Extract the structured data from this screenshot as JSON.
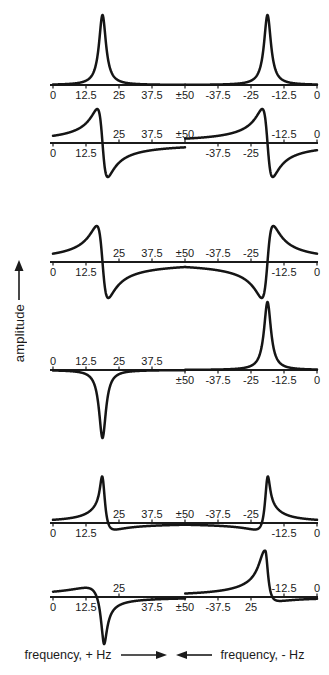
{
  "figure": {
    "ylabel": "amplitude",
    "xlabel_positive": "frequency, + Hz",
    "xlabel_negative": "frequency, - Hz"
  },
  "chart_data": {
    "type": "line",
    "title": "",
    "xlabel": "frequency (+ Hz left half, - Hz right half)",
    "ylabel": "amplitude",
    "x_axis": {
      "unit": "Hz",
      "layout": "positive frequencies 0 to +50 run left-to-right on the left half; negative frequencies -50 to 0 run left-to-right on the right half; axis wraps at ±50",
      "tick_labels": [
        "0",
        "12.5",
        "25",
        "37.5",
        "±50",
        "-37.5",
        "-25",
        "-12.5",
        "0"
      ],
      "tick_values_hz": [
        0,
        12.5,
        25,
        37.5,
        50,
        -37.5,
        -25,
        -12.5,
        0
      ]
    },
    "peak_frequencies_hz": [
      18.75,
      -18.75
    ],
    "geometry": {
      "width": 329,
      "height": 675,
      "x_at_u0": 53,
      "x_at_u100": 317,
      "axis_x1": 50,
      "axis_x2": 318
    },
    "panels": [
      {
        "name": "absorption-doublet-both-positive",
        "axis_y": 85,
        "components_pos": [
          {
            "kind": "abs",
            "f": 18.75,
            "w": 1.6,
            "amp": 70
          }
        ],
        "components_neg": [
          {
            "kind": "abs",
            "f": -18.75,
            "w": 1.6,
            "amp": 70
          }
        ],
        "ticks": [
          {
            "label": "0",
            "u": 0,
            "side": "below"
          },
          {
            "label": "12.5",
            "u": 12.5,
            "side": "below"
          },
          {
            "label": "25",
            "u": 25,
            "side": "below"
          },
          {
            "label": "37.5",
            "u": 37.5,
            "side": "below"
          },
          {
            "label": "±50",
            "u": 50,
            "side": "below"
          },
          {
            "label": "-37.5",
            "u": 62.5,
            "side": "below"
          },
          {
            "label": "-25",
            "u": 75,
            "side": "below"
          },
          {
            "label": "-12.5",
            "u": 87.5,
            "side": "below"
          },
          {
            "label": "0",
            "u": 100,
            "side": "below"
          }
        ]
      },
      {
        "name": "dispersion-doublet-same-sign",
        "axis_y": 143,
        "components_pos": [
          {
            "kind": "disp",
            "f": 18.75,
            "w": 2.0,
            "amp": 34
          }
        ],
        "components_neg": [
          {
            "kind": "disp",
            "f": -18.75,
            "w": 2.0,
            "amp": 34
          }
        ],
        "ticks": [
          {
            "label": "0",
            "u": 0,
            "side": "below"
          },
          {
            "label": "12.5",
            "u": 12.5,
            "side": "below"
          },
          {
            "label": "25",
            "u": 25,
            "side": "above"
          },
          {
            "label": "37.5",
            "u": 37.5,
            "side": "above"
          },
          {
            "label": "±50",
            "u": 50,
            "side": "above"
          },
          {
            "label": "-37.5",
            "u": 62.5,
            "side": "below"
          },
          {
            "label": "-25",
            "u": 75,
            "side": "below"
          },
          {
            "label": "-12.5",
            "u": 87.5,
            "side": "above"
          },
          {
            "label": "0",
            "u": 100,
            "side": "above"
          }
        ]
      },
      {
        "name": "dispersion-doublet-opposite-sign-broad-negative-middle",
        "axis_y": 262,
        "components_pos": [
          {
            "kind": "disp",
            "f": 18.75,
            "w": 2.2,
            "amp": 36
          }
        ],
        "components_neg": [
          {
            "kind": "disp",
            "f": -18.75,
            "w": 2.2,
            "amp": -36
          }
        ],
        "ticks": [
          {
            "label": "0",
            "u": 0,
            "side": "below"
          },
          {
            "label": "12.5",
            "u": 12.5,
            "side": "below"
          },
          {
            "label": "25",
            "u": 25,
            "side": "above"
          },
          {
            "label": "37.5",
            "u": 37.5,
            "side": "above"
          },
          {
            "label": "±50",
            "u": 50,
            "side": "above"
          },
          {
            "label": "-37.5",
            "u": 62.5,
            "side": "above"
          },
          {
            "label": "-25",
            "u": 75,
            "side": "above"
          },
          {
            "label": "-12.5",
            "u": 87.5,
            "side": "below"
          },
          {
            "label": "0",
            "u": 100,
            "side": "below"
          }
        ]
      },
      {
        "name": "antiphase-absorption-doublet",
        "axis_y": 370,
        "components_pos": [
          {
            "kind": "abs",
            "f": 18.75,
            "w": 1.6,
            "amp": -68
          }
        ],
        "components_neg": [
          {
            "kind": "abs",
            "f": -18.75,
            "w": 1.6,
            "amp": 68
          }
        ],
        "ticks": [
          {
            "label": "0",
            "u": 0,
            "side": "above"
          },
          {
            "label": "12.5",
            "u": 12.5,
            "side": "above"
          },
          {
            "label": "25",
            "u": 25,
            "side": "above"
          },
          {
            "label": "37.5",
            "u": 37.5,
            "side": "above"
          },
          {
            "label": "±50",
            "u": 50,
            "side": "below"
          },
          {
            "label": "-37.5",
            "u": 62.5,
            "side": "below"
          },
          {
            "label": "-25",
            "u": 75,
            "side": "below"
          },
          {
            "label": "-12.5",
            "u": 87.5,
            "side": "below"
          },
          {
            "label": "0",
            "u": 100,
            "side": "below"
          }
        ]
      },
      {
        "name": "mixed-phase-doublet",
        "axis_y": 523,
        "components_pos": [
          {
            "kind": "abs",
            "f": 18.75,
            "w": 1.2,
            "amp": 46
          },
          {
            "kind": "disp",
            "f": 18.75,
            "w": 2.6,
            "amp": 11
          }
        ],
        "components_neg": [
          {
            "kind": "abs",
            "f": -18.75,
            "w": 1.2,
            "amp": 46
          },
          {
            "kind": "disp",
            "f": -18.75,
            "w": 2.6,
            "amp": -11
          }
        ],
        "ticks": [
          {
            "label": "0",
            "u": 0,
            "side": "below"
          },
          {
            "label": "12.5",
            "u": 12.5,
            "side": "below"
          },
          {
            "label": "25",
            "u": 25,
            "side": "above"
          },
          {
            "label": "37.5",
            "u": 37.5,
            "side": "above"
          },
          {
            "label": "±50",
            "u": 50,
            "side": "above"
          },
          {
            "label": "-37.5",
            "u": 62.5,
            "side": "above"
          },
          {
            "label": "-25",
            "u": 75,
            "side": "above"
          },
          {
            "label": "-12.5",
            "u": 87.5,
            "side": "below"
          },
          {
            "label": "0",
            "u": 100,
            "side": "below"
          }
        ]
      },
      {
        "name": "strong-phase-twist-doublet",
        "axis_y": 597,
        "components_pos": [
          {
            "kind": "abs",
            "f": 19.2,
            "w": 1.3,
            "amp": -42
          },
          {
            "kind": "disp",
            "f": 18.8,
            "w": 5,
            "wr": 2,
            "amp": 11
          }
        ],
        "components_neg": [
          {
            "kind": "abs",
            "f": -19.5,
            "w": 3,
            "wr": 1.2,
            "amp": 46
          },
          {
            "kind": "disp",
            "f": -19.5,
            "w": 6,
            "wr": 2.5,
            "amp": 8
          }
        ],
        "ticks": [
          {
            "label": "0",
            "u": 0,
            "side": "below"
          },
          {
            "label": "12.5",
            "u": 12.5,
            "side": "below"
          },
          {
            "label": "25",
            "u": 25,
            "side": "above"
          },
          {
            "label": "37.5",
            "u": 37.5,
            "side": "below"
          },
          {
            "label": "±50",
            "u": 50,
            "side": "below"
          },
          {
            "label": "-37.5",
            "u": 62.5,
            "side": "below"
          },
          {
            "label": "25",
            "u": 75,
            "side": "below"
          },
          {
            "label": "-12.5",
            "u": 87.5,
            "side": "above"
          },
          {
            "label": "0",
            "u": 100,
            "side": "above"
          }
        ]
      }
    ]
  }
}
